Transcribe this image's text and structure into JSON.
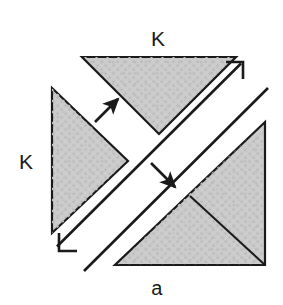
{
  "figure": {
    "caption": "a",
    "labels": [
      {
        "id": "k-top",
        "text": "K",
        "x": 158,
        "y": 38
      },
      {
        "id": "k-left",
        "text": "K",
        "x": 26,
        "y": 161
      }
    ],
    "colors": {
      "background": "#ffffff",
      "surface_fill": "#cccccc",
      "texture_dot": "#b3b3b3",
      "outline": "#1a1a1a",
      "band_stroke": "#1a1a1a",
      "arrow": "#1a1a1a",
      "label_text": "#1a1a1a"
    },
    "geometry": {
      "top_triangle": {
        "name": "down-pointing-triangle-top",
        "points": "82,57 236,57 159,134"
      },
      "left_triangle": {
        "name": "right-pointing-triangle-left",
        "points": "52,88 128,161 52,233"
      },
      "bottom_right_triangle": {
        "name": "large-triangle-bottom-right",
        "points": "265,122 265,265 115,265"
      },
      "bottom_right_crease": {
        "name": "internal-fold-line",
        "x1": 190,
        "y1": 196,
        "x2": 265,
        "y2": 265
      },
      "band": {
        "name": "diagonal-band",
        "upper_edge": {
          "x1": 58,
          "y1": 247,
          "x2": 242,
          "y2": 64
        },
        "lower_edge": {
          "x1": 83,
          "y1": 272,
          "x2": 267,
          "y2": 88
        },
        "top_end_hook": "225,62 243,62 243,80",
        "bottom_end_hook": "78,252 60,252 60,234"
      },
      "arrows": [
        {
          "id": "arrow-up-right",
          "x1": 95,
          "y1": 122,
          "x2": 119,
          "y2": 98
        },
        {
          "id": "arrow-down-right",
          "x1": 151,
          "y1": 163,
          "x2": 176,
          "y2": 188
        }
      ]
    }
  }
}
